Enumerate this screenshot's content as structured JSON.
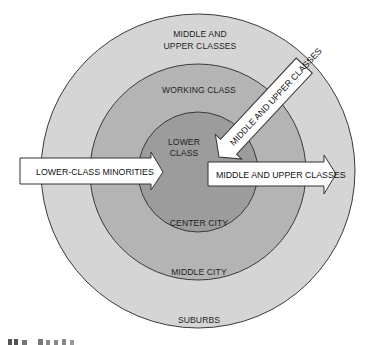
{
  "diagram": {
    "type": "concentric-zones",
    "colors": {
      "background": "#ffffff",
      "outer_ring": "#d5d5d5",
      "middle_ring": "#b4b4b4",
      "inner_circle": "#9c9c9c",
      "stroke": "#3a3a3a",
      "arrow_fill": "#ffffff"
    },
    "zones": {
      "outer": {
        "group": "MIDDLE AND\nUPPER CLASSES",
        "group_line1": "MIDDLE AND",
        "group_line2": "UPPER CLASSES",
        "place": "SUBURBS"
      },
      "middle": {
        "group": "WORKING CLASS",
        "place": "MIDDLE CITY"
      },
      "inner": {
        "group": "LOWER\nCLASS",
        "group_line1": "LOWER",
        "group_line2": "CLASS",
        "place": "CENTER CITY"
      }
    },
    "arrows": [
      {
        "id": "in-left",
        "label": "LOWER-CLASS MINORITIES",
        "direction": "inward"
      },
      {
        "id": "out-right",
        "label": "MIDDLE AND UPPER CLASSES",
        "direction": "outward"
      },
      {
        "id": "in-diagonal",
        "label": "MIDDLE AND UPPER CLASSES",
        "direction": "inward"
      }
    ],
    "caption_fragment": "..."
  }
}
